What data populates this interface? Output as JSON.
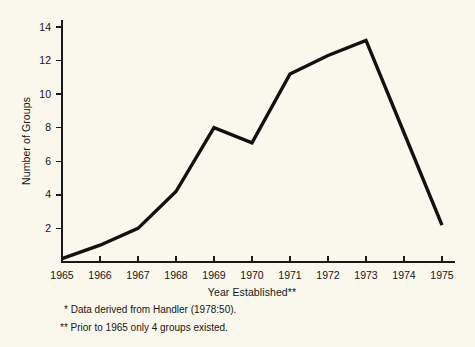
{
  "figure": {
    "background_color": "#faf7ec",
    "ink_color": "#111111"
  },
  "chart_data": {
    "type": "line",
    "title": "",
    "subtitle": "",
    "xlabel": "Year Established**",
    "ylabel": "Number of Groups",
    "categories": [
      "1965",
      "1966",
      "1967",
      "1968",
      "1969",
      "1970",
      "1971",
      "1972",
      "1973",
      "1974",
      "1975"
    ],
    "x": [
      1965,
      1966,
      1967,
      1968,
      1969,
      1970,
      1971,
      1972,
      1973,
      1974,
      1975
    ],
    "values": [
      0.2,
      1.0,
      2.0,
      4.2,
      8.0,
      7.1,
      11.2,
      12.3,
      13.2,
      7.7,
      2.2
    ],
    "series": [
      {
        "name": "Number of Groups",
        "values": [
          0.2,
          1.0,
          2.0,
          4.2,
          8.0,
          7.1,
          11.2,
          12.3,
          13.2,
          7.7,
          2.2
        ]
      }
    ],
    "xlim": [
      1965,
      1975
    ],
    "ylim": [
      0,
      15
    ],
    "yticks": [
      2,
      4,
      6,
      8,
      10,
      12,
      14
    ],
    "ytick_labels": [
      "2",
      "4",
      "6",
      "8",
      "10",
      "12",
      "14"
    ],
    "xtick_labels": [
      "1965",
      "1966",
      "1967",
      "1968",
      "1969",
      "1970",
      "1971",
      "1972",
      "1973",
      "1974",
      "1975"
    ],
    "grid": false,
    "legend": null,
    "legend_position": "none",
    "line_color": "#111111",
    "markers": false,
    "annotations": []
  },
  "footnotes": [
    "* Data derived from Handler (1978:50).",
    "** Prior to 1965 only 4 groups existed."
  ]
}
